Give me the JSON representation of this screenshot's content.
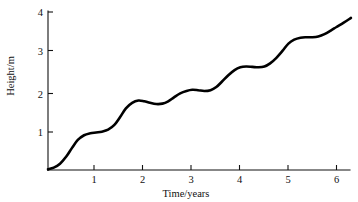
{
  "chart_data": {
    "type": "line",
    "title": "",
    "subtitle": "",
    "xlabel": "Time/years",
    "ylabel": "Height/m",
    "xlim": [
      0,
      6.55
    ],
    "ylim": [
      0,
      4.15
    ],
    "xticks": [
      1,
      2,
      3,
      4,
      5,
      6
    ],
    "xtick_labels": [
      "1",
      "2",
      "3",
      "4",
      "5",
      "6"
    ],
    "yticks": [
      1,
      2,
      3,
      4
    ],
    "ytick_labels": [
      "1",
      "2",
      "3",
      "4"
    ],
    "grid": false,
    "legend": false,
    "legend_position": "none",
    "annotations": [],
    "series": [
      {
        "name": "Height",
        "color": "#000000",
        "line_width": 2.6,
        "marker": "none",
        "description": "Stepped sigmoidal growth curve: periods of rapid growth alternating with plateaus, one step per year",
        "x": [
          0.0,
          0.12,
          0.25,
          0.38,
          0.5,
          0.62,
          0.75,
          0.88,
          1.0,
          1.12,
          1.25,
          1.38,
          1.5,
          1.62,
          1.75,
          1.88,
          2.0,
          2.12,
          2.25,
          2.38,
          2.5,
          2.62,
          2.75,
          2.88,
          3.0,
          3.12,
          3.25,
          3.38,
          3.5,
          3.62,
          3.75,
          3.88,
          4.0,
          4.12,
          4.25,
          4.38,
          4.5,
          4.62,
          4.75,
          4.88,
          5.0,
          5.12,
          5.25,
          5.38,
          5.5,
          5.62,
          5.75,
          5.88,
          6.0,
          6.15,
          6.3
        ],
        "y": [
          0.02,
          0.06,
          0.16,
          0.34,
          0.56,
          0.76,
          0.88,
          0.93,
          0.95,
          0.97,
          1.02,
          1.14,
          1.34,
          1.56,
          1.7,
          1.76,
          1.74,
          1.7,
          1.67,
          1.68,
          1.74,
          1.84,
          1.94,
          2.0,
          2.03,
          2.02,
          2.0,
          2.02,
          2.1,
          2.24,
          2.4,
          2.53,
          2.6,
          2.62,
          2.61,
          2.6,
          2.62,
          2.7,
          2.84,
          3.02,
          3.2,
          3.3,
          3.35,
          3.36,
          3.36,
          3.38,
          3.44,
          3.53,
          3.62,
          3.73,
          3.85
        ]
      }
    ],
    "plateaus": [
      0.95,
      1.7,
      2.02,
      2.61,
      3.36
    ],
    "start_point": [
      0,
      0
    ],
    "end_point": [
      6.3,
      3.85
    ]
  }
}
